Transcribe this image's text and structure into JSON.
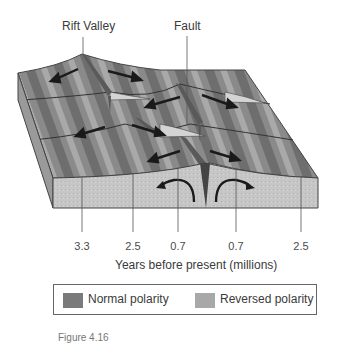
{
  "labels": {
    "rift_valley": "Rift Valley",
    "fault": "Fault"
  },
  "axis": {
    "title": "Years before present (millions)",
    "ticks": [
      "3.3",
      "2.5",
      "0.7",
      "0.7",
      "2.5"
    ]
  },
  "legend": {
    "items": [
      {
        "label": "Normal polarity",
        "color": "#7a7a7a"
      },
      {
        "label": "Reversed polarity",
        "color": "#a8a8a8"
      }
    ]
  },
  "caption": "Figure 4.16",
  "colors": {
    "normal": "#7a7a7a",
    "reversed": "#a8a8a8",
    "face": "#c4c4c4",
    "outline": "#444444"
  }
}
